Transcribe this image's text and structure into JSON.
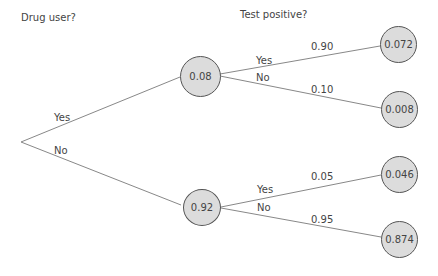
{
  "headers": {
    "level1": "Drug user?",
    "level2": "Test positive?"
  },
  "tree": {
    "root_branches": [
      {
        "label": "Yes",
        "node_value": "0.08"
      },
      {
        "label": "No",
        "node_value": "0.92"
      }
    ],
    "second_level": [
      {
        "parent": "0.08",
        "branch_label": "Yes",
        "probability": "0.90",
        "leaf_value": "0.072"
      },
      {
        "parent": "0.08",
        "branch_label": "No",
        "probability": "0.10",
        "leaf_value": "0.008"
      },
      {
        "parent": "0.92",
        "branch_label": "Yes",
        "probability": "0.05",
        "leaf_value": "0.046"
      },
      {
        "parent": "0.92",
        "branch_label": "No",
        "probability": "0.95",
        "leaf_value": "0.874"
      }
    ]
  },
  "colors": {
    "node_fill": "#dcdcdc",
    "node_stroke": "#555555",
    "line": "#888888",
    "text": "#444444"
  }
}
